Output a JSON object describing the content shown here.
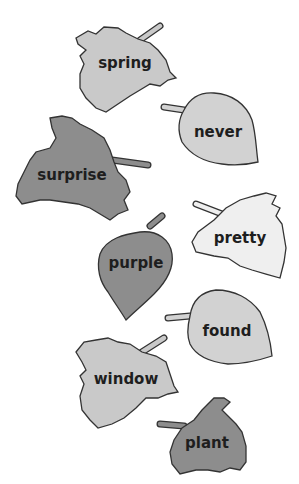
{
  "colors": {
    "light": "#c9c9c9",
    "lighter": "#d2d2d2",
    "pale": "#efefef",
    "dark": "#8d8d8d",
    "outline": "#333333",
    "text": "#1e1e1e"
  },
  "leaves": [
    {
      "word": "spring",
      "shade": "light"
    },
    {
      "word": "never",
      "shade": "lighter"
    },
    {
      "word": "surprise",
      "shade": "dark"
    },
    {
      "word": "pretty",
      "shade": "pale"
    },
    {
      "word": "purple",
      "shade": "dark"
    },
    {
      "word": "found",
      "shade": "lighter"
    },
    {
      "word": "window",
      "shade": "light"
    },
    {
      "word": "plant",
      "shade": "dark"
    }
  ]
}
